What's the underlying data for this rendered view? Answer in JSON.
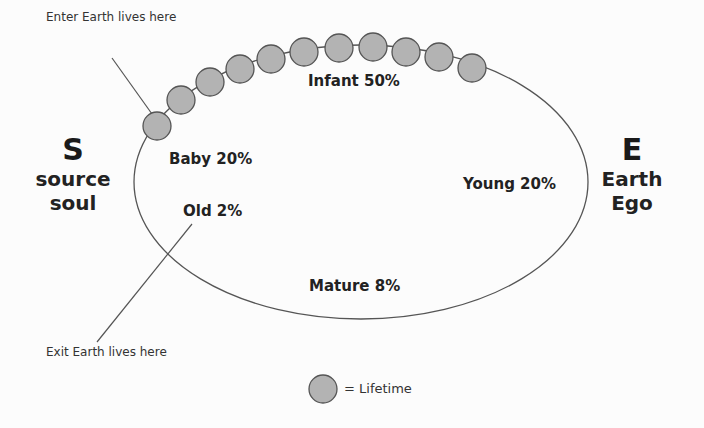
{
  "annotations": {
    "enter": "Enter Earth lives here",
    "exit": "Exit Earth lives here"
  },
  "left_pole": {
    "letter": "S",
    "line1": "source",
    "line2": "soul"
  },
  "right_pole": {
    "letter": "E",
    "line1": "Earth",
    "line2": "Ego"
  },
  "stages": {
    "infant": "Infant 50%",
    "baby": "Baby 20%",
    "young": "Young 20%",
    "mature": "Mature 8%",
    "old": "Old 2%"
  },
  "legend": {
    "label": "= Lifetime"
  },
  "colors": {
    "circle_fill": "#b3b3b3",
    "circle_stroke": "#555555",
    "line": "#555555"
  }
}
